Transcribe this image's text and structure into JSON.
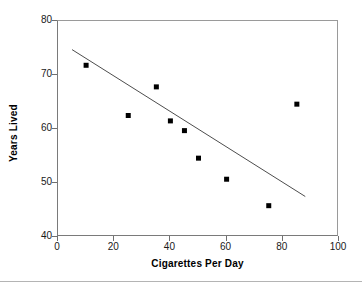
{
  "chart_data": {
    "type": "scatter",
    "title": "",
    "xlabel": "Cigarettes Per Day",
    "ylabel": "Years Lived",
    "xlim": [
      0,
      100
    ],
    "ylim": [
      40,
      80
    ],
    "xticks": [
      "0",
      "20",
      "40",
      "60",
      "80",
      "100"
    ],
    "xtick_values": [
      0,
      20,
      40,
      60,
      80,
      100
    ],
    "yticks": [
      "80",
      "70",
      "60",
      "50",
      "40"
    ],
    "ytick_values": [
      80,
      70,
      60,
      50,
      40
    ],
    "grid": false,
    "legend": null,
    "marker": "filled-square",
    "marker_color": "#000000",
    "points": [
      {
        "x": 10,
        "y": 71.8
      },
      {
        "x": 25,
        "y": 62.5
      },
      {
        "x": 35,
        "y": 67.8
      },
      {
        "x": 40,
        "y": 61.5
      },
      {
        "x": 45,
        "y": 59.7
      },
      {
        "x": 50,
        "y": 54.6
      },
      {
        "x": 60,
        "y": 50.7
      },
      {
        "x": 75,
        "y": 45.8
      },
      {
        "x": 85,
        "y": 64.6
      }
    ],
    "series": [
      {
        "name": "Years Lived vs Cigarettes Per Day",
        "type": "scatter",
        "x": [
          10,
          25,
          35,
          40,
          45,
          50,
          60,
          75,
          85
        ],
        "values": [
          71.8,
          62.5,
          67.8,
          61.5,
          59.7,
          54.6,
          50.7,
          45.8,
          64.6
        ]
      },
      {
        "name": "trend line",
        "type": "line",
        "x": [
          5,
          88
        ],
        "values": [
          74.7,
          47.5
        ],
        "color": "#4d4d4d"
      }
    ],
    "trendline": {
      "x_start": 5,
      "y_start": 74.7,
      "x_end": 88,
      "y_end": 47.5,
      "color": "#4d4d4d"
    }
  },
  "colors": {
    "marker": "#000000",
    "trendline": "#4d4d4d",
    "axis": "#7a7a7a",
    "frame": "#9a9a9a",
    "tick_text": "#1a1a1a",
    "divider": "#b4b4b4",
    "background": "#ffffff"
  }
}
